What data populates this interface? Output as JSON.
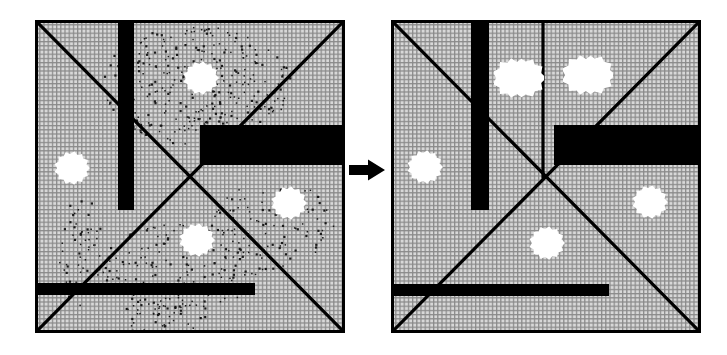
{
  "figure": {
    "kind": "diagram",
    "background_color": "#ffffff",
    "ink_color": "#000000",
    "grid_color": "#8a8a8a",
    "grid_fill": "#d8d8d8"
  },
  "arrow": {
    "name": "right-arrow",
    "glyph": "➡",
    "color": "#000000",
    "x": 349,
    "y": 170,
    "width": 36,
    "height": 22
  },
  "panels": [
    {
      "id": "left",
      "name": "before-subdivision",
      "frame": {
        "x": 35,
        "y": 20,
        "width": 310,
        "height": 313
      },
      "border_color": "#000000",
      "border_width": 3,
      "center": {
        "x": 151,
        "y": 161
      },
      "lines": [
        {
          "name": "diagonal-nwse",
          "x1": 0,
          "y1": 0,
          "x2": 310,
          "y2": 313
        },
        {
          "name": "diagonal-swne",
          "x1": 0,
          "y1": 313,
          "x2": 310,
          "y2": 0
        }
      ],
      "obstacles": [
        {
          "name": "vertical-bar",
          "x": 83,
          "y": 0,
          "width": 16,
          "height": 190
        },
        {
          "name": "right-block",
          "x": 165,
          "y": 105,
          "width": 145,
          "height": 40
        },
        {
          "name": "bottom-bar",
          "x": 0,
          "y": 263,
          "width": 220,
          "height": 12
        }
      ],
      "noise_regions": [
        {
          "name": "noise-t2",
          "cx": 160,
          "cy": 65,
          "rx": 95,
          "ry": 60,
          "count": 330
        },
        {
          "name": "noise-t1",
          "cx": 235,
          "cy": 205,
          "rx": 65,
          "ry": 45,
          "count": 95
        },
        {
          "name": "noise-t4",
          "cx": 145,
          "cy": 245,
          "rx": 80,
          "ry": 45,
          "count": 150
        },
        {
          "name": "noise-t3-trail",
          "cx": 45,
          "cy": 230,
          "rx": 22,
          "ry": 55,
          "count": 60
        },
        {
          "name": "noise-bottom-trail",
          "cx": 130,
          "cy": 295,
          "rx": 45,
          "ry": 22,
          "count": 55
        }
      ],
      "labels": [
        {
          "name": "label-t2",
          "base": "T",
          "sub": "2",
          "x": 201,
          "y": 78
        },
        {
          "name": "label-t3",
          "base": "T",
          "sub": "3",
          "x": 72,
          "y": 168
        },
        {
          "name": "label-t1",
          "base": "T",
          "sub": "1",
          "x": 289,
          "y": 203
        },
        {
          "name": "label-t4",
          "base": "T",
          "sub": "4",
          "x": 197,
          "y": 240
        }
      ]
    },
    {
      "id": "right",
      "name": "after-subdivision",
      "frame": {
        "x": 391,
        "y": 20,
        "width": 310,
        "height": 313
      },
      "border_color": "#000000",
      "border_width": 3,
      "center": {
        "x": 152,
        "y": 157
      },
      "lines": [
        {
          "name": "diagonal-nwse",
          "x1": 0,
          "y1": 0,
          "x2": 310,
          "y2": 313
        },
        {
          "name": "diagonal-swne",
          "x1": 0,
          "y1": 313,
          "x2": 310,
          "y2": 0
        },
        {
          "name": "vertical-split",
          "x1": 152,
          "y1": 0,
          "x2": 152,
          "y2": 157
        }
      ],
      "obstacles": [
        {
          "name": "vertical-bar",
          "x": 80,
          "y": 0,
          "width": 18,
          "height": 190
        },
        {
          "name": "right-block",
          "x": 163,
          "y": 105,
          "width": 147,
          "height": 40
        },
        {
          "name": "bottom-bar",
          "x": 0,
          "y": 264,
          "width": 218,
          "height": 12
        }
      ],
      "noise_regions": [],
      "labels": [
        {
          "name": "label-t21",
          "base": "T",
          "sub": "21",
          "x": 519,
          "y": 78
        },
        {
          "name": "label-t22",
          "base": "T",
          "sub": "22",
          "x": 588,
          "y": 75
        },
        {
          "name": "label-t3",
          "base": "T",
          "sub": "3",
          "x": 425,
          "y": 167
        },
        {
          "name": "label-t1",
          "base": "T",
          "sub": "1",
          "x": 650,
          "y": 202
        },
        {
          "name": "label-t4",
          "base": "T",
          "sub": "4",
          "x": 547,
          "y": 243
        }
      ]
    }
  ]
}
